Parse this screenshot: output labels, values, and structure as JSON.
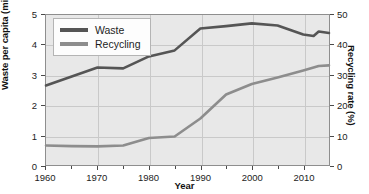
{
  "chart_data": {
    "type": "line",
    "title": "",
    "xlabel": "Year",
    "ylabel": "Waste per capita (million tons)",
    "y2label": "Recycling rate (%)",
    "xlim": [
      1960,
      2015
    ],
    "ylim": [
      0,
      5
    ],
    "y2lim": [
      0,
      50
    ],
    "grid": true,
    "legend_position": "top-left",
    "xticks": [
      1960,
      1970,
      1980,
      1990,
      2000,
      2010
    ],
    "xtick_labels": [
      "1960",
      "1970",
      "1980",
      "1990",
      "2000",
      "2010"
    ],
    "yticks_left": [
      0,
      1,
      2,
      3,
      4,
      5
    ],
    "ytick_labels_left": [
      "0",
      "1",
      "2",
      "3",
      "4",
      "5"
    ],
    "yticks_right": [
      0,
      10,
      20,
      30,
      40,
      50
    ],
    "ytick_labels_right": [
      "0",
      "10",
      "20",
      "30",
      "40",
      "50"
    ],
    "x": [
      1960,
      1965,
      1970,
      1975,
      1980,
      1985,
      1990,
      1995,
      2000,
      2005,
      2010,
      2012,
      2013,
      2015
    ],
    "series": [
      {
        "name": "Waste",
        "axis": "left",
        "color": "#555555",
        "values": [
          2.65,
          2.95,
          3.25,
          3.22,
          3.62,
          3.82,
          4.55,
          4.63,
          4.72,
          4.65,
          4.35,
          4.3,
          4.45,
          4.4
        ]
      },
      {
        "name": "Recycling",
        "axis": "left",
        "color": "#8d8d8d",
        "values": [
          0.65,
          0.63,
          0.62,
          0.65,
          0.9,
          0.95,
          1.55,
          2.35,
          2.7,
          2.92,
          3.15,
          3.25,
          3.3,
          3.32
        ]
      }
    ],
    "legend": [
      {
        "label": "Waste",
        "color": "#555555"
      },
      {
        "label": "Recycling",
        "color": "#8d8d8d"
      }
    ]
  },
  "figure": {
    "caption_fragment": ""
  }
}
